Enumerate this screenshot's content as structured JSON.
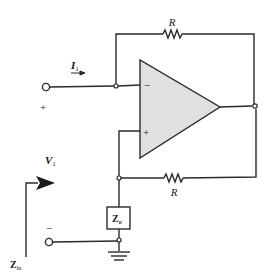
{
  "diagram": {
    "type": "op-amp circuit",
    "colors": {
      "wire": "#2a2a2a",
      "opamp_fill": "#e0e0e0",
      "background": "#ffffff"
    },
    "labels": {
      "r_top": "R",
      "r_bottom": "R",
      "current_main": "I",
      "current_sub": "1",
      "voltage_main": "V",
      "voltage_sub": "1",
      "zo_main": "Z",
      "zo_sub": "o",
      "zin_main": "Z",
      "zin_sub": "in",
      "plus_terminal": "+",
      "minus_terminal": "−",
      "opamp_inverting": "−",
      "opamp_noninverting": "+"
    },
    "components": [
      {
        "id": "r_top",
        "kind": "resistor",
        "label": "R"
      },
      {
        "id": "r_bottom",
        "kind": "resistor",
        "label": "R"
      },
      {
        "id": "opamp",
        "kind": "op-amp"
      },
      {
        "id": "zo",
        "kind": "impedance",
        "label": "Zo"
      },
      {
        "id": "ground",
        "kind": "ground"
      }
    ]
  }
}
